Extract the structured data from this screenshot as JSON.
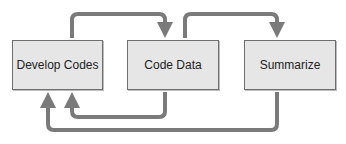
{
  "diagram": {
    "type": "process-flow",
    "nodes": [
      {
        "id": "develop",
        "label": "Develop Codes"
      },
      {
        "id": "code",
        "label": "Code Data"
      },
      {
        "id": "summarize",
        "label": "Summarize"
      }
    ],
    "edges": [
      {
        "from": "develop",
        "to": "code",
        "route": "top"
      },
      {
        "from": "code",
        "to": "summarize",
        "route": "top"
      },
      {
        "from": "code",
        "to": "develop",
        "route": "bottom-inner"
      },
      {
        "from": "summarize",
        "to": "develop",
        "route": "bottom-outer"
      }
    ],
    "colors": {
      "box_fill": "#e6e6e6",
      "box_border": "#6e6e6e",
      "arrow": "#7a7a7a",
      "text": "#222222"
    }
  }
}
